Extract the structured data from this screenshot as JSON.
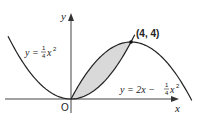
{
  "diagram": {
    "type": "coordinate-graph",
    "axes": {
      "x_label": "x",
      "y_label": "y",
      "origin_label": "O"
    },
    "curves": [
      {
        "id": "parabola-up",
        "equation": "y = 1/4 x^2",
        "label_lhs": "y = ",
        "label_frac_num": "1",
        "label_frac_den": "4",
        "label_rhs": "x",
        "label_exp": "2",
        "a": 0.25,
        "b": 0,
        "x_range": [
          -4.2,
          4.25
        ]
      },
      {
        "id": "parabola-down",
        "equation": "y = 2x - 1/4 x^2",
        "label_lhs": "y = 2x − ",
        "label_frac_num": "1",
        "label_frac_den": "4",
        "label_rhs": "x",
        "label_exp": "2",
        "a": -0.25,
        "b": 2,
        "x_range": [
          0,
          8.05
        ]
      }
    ],
    "intersection": {
      "x": 4,
      "y": 4,
      "label": "(4, 4)"
    },
    "shaded_region": {
      "between": [
        "parabola-down",
        "parabola-up"
      ],
      "x_range": [
        0,
        4
      ],
      "color": "#d9d9d9"
    },
    "colors": {
      "curve": "#222222",
      "axis": "#444444",
      "shade": "#d9d9d9"
    }
  }
}
